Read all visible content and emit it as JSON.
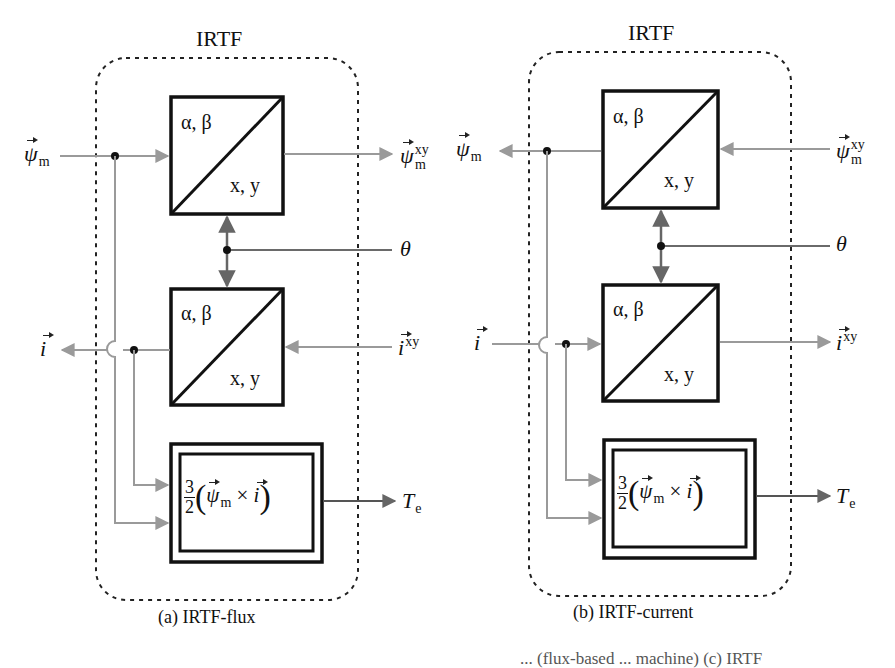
{
  "figure": {
    "panels": [
      {
        "id": "a",
        "header": "IRTF",
        "caption": "(a) IRTF-flux",
        "top_block": {
          "upper_label": "α, β",
          "lower_label": "x, y"
        },
        "bottom_block": {
          "upper_label": "α, β",
          "lower_label": "x, y"
        },
        "torque_block": {
          "fraction_num": "3",
          "fraction_den": "2",
          "expr_psi": "ψ",
          "expr_psi_sub": "m",
          "expr_times": "×",
          "expr_i": "i"
        },
        "signals": {
          "psi_m": {
            "base": "ψ",
            "sub": "m",
            "direction": "input"
          },
          "psi_m_xy": {
            "base": "ψ",
            "sub": "m",
            "sup": "xy",
            "direction": "output"
          },
          "theta": {
            "base": "θ",
            "direction": "input"
          },
          "i": {
            "base": "i",
            "direction": "output"
          },
          "i_xy": {
            "base": "i",
            "sup": "xy",
            "direction": "input"
          },
          "Te": {
            "base": "T",
            "sub": "e",
            "direction": "output"
          }
        }
      },
      {
        "id": "b",
        "header": "IRTF",
        "caption": "(b) IRTF-current",
        "top_block": {
          "upper_label": "α, β",
          "lower_label": "x, y"
        },
        "bottom_block": {
          "upper_label": "α, β",
          "lower_label": "x, y"
        },
        "torque_block": {
          "fraction_num": "3",
          "fraction_den": "2",
          "expr_psi": "ψ",
          "expr_psi_sub": "m",
          "expr_times": "×",
          "expr_i": "i"
        },
        "signals": {
          "psi_m": {
            "base": "ψ",
            "sub": "m",
            "direction": "output"
          },
          "psi_m_xy": {
            "base": "ψ",
            "sub": "m",
            "sup": "xy",
            "direction": "input"
          },
          "theta": {
            "base": "θ",
            "direction": "input"
          },
          "i": {
            "base": "i",
            "direction": "input"
          },
          "i_xy": {
            "base": "i",
            "sup": "xy",
            "direction": "output"
          },
          "Te": {
            "base": "T",
            "sub": "e",
            "direction": "output"
          }
        }
      }
    ],
    "footer_fragment": "... (flux-based ... machine) (c) IRTF",
    "colors": {
      "signal_line": "#9a9a9a",
      "theta_line": "#6a6a6a",
      "block_border": "#111111",
      "dashed_border": "#222222"
    }
  }
}
